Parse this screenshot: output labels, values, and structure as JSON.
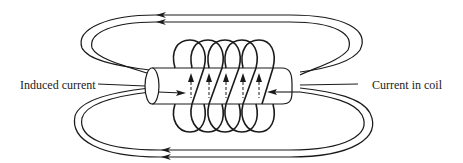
{
  "labels": {
    "induced_current": "Induced current",
    "current_in_coil": "Current in coil"
  },
  "colors": {
    "line": "#1a1a1a",
    "background": "#ffffff"
  },
  "figure": {
    "coil_turns": 5,
    "field_loops_top": 2,
    "field_loops_bottom": 2,
    "field_arrow_direction": "left",
    "coil_current_arrow_direction": "up"
  }
}
